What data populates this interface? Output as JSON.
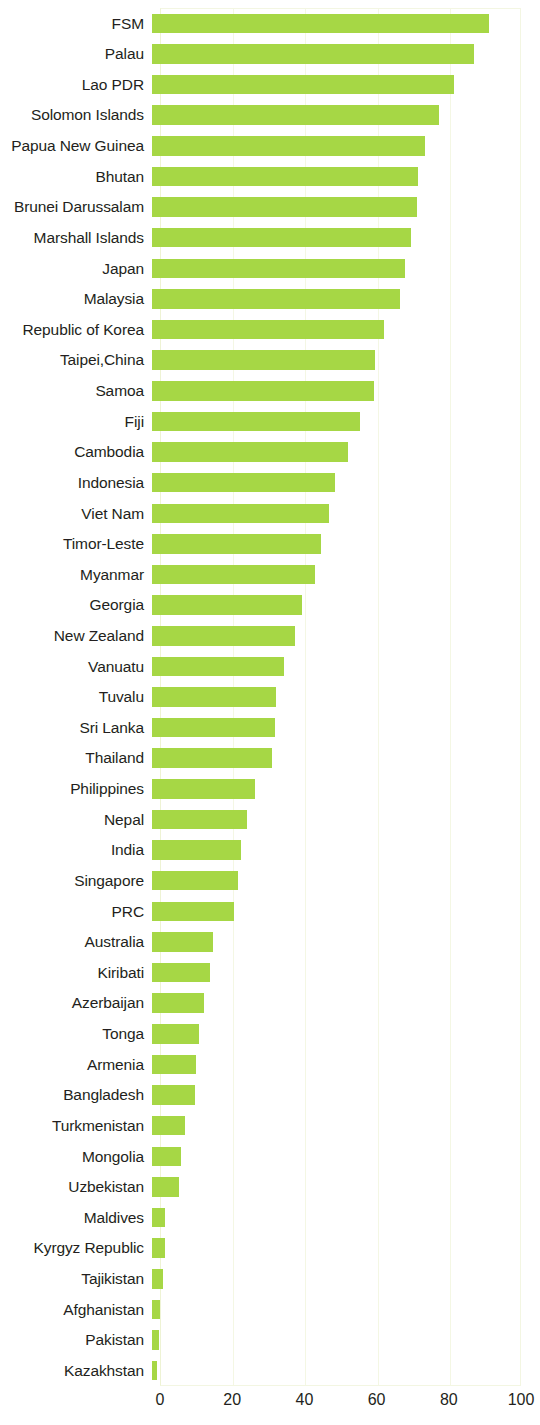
{
  "chart_data": {
    "type": "bar",
    "orientation": "horizontal",
    "title": "",
    "subtitle": "",
    "xlabel": "",
    "ylabel": "",
    "xlim": [
      0,
      100
    ],
    "xticks": [
      "0",
      "20",
      "40",
      "60",
      "80",
      "100"
    ],
    "xtick_values": [
      0,
      20,
      40,
      60,
      80,
      100
    ],
    "grid": true,
    "grid_axis": "x",
    "legend": null,
    "bar_color": "#a6d745",
    "plot_border_color": "#f3f6e2",
    "categories": [
      "FSM",
      "Palau",
      "Lao PDR",
      "Solomon Islands",
      "Papua New Guinea",
      "Bhutan",
      "Brunei Darussalam",
      "Marshall Islands",
      "Japan",
      "Malaysia",
      "Republic of Korea",
      "Taipei,China",
      "Samoa",
      "Fiji",
      "Cambodia",
      "Indonesia",
      "Viet Nam",
      "Timor-Leste",
      "Myanmar",
      "Georgia",
      "New Zealand",
      "Vanuatu",
      "Tuvalu",
      "Sri Lanka",
      "Thailand",
      "Philippines",
      "Nepal",
      "India",
      "Singapore",
      "PRC",
      "Australia",
      "Kiribati",
      "Azerbaijan",
      "Tonga",
      "Armenia",
      "Bangladesh",
      "Turkmenistan",
      "Mongolia",
      "Uzbekistan",
      "Maldives",
      "Kyrgyz Republic",
      "Tajikistan",
      "Afghanistan",
      "Pakistan",
      "Kazakhstan"
    ],
    "values": [
      93.4,
      89.1,
      83.7,
      79.4,
      75.6,
      73.8,
      73.5,
      71.7,
      70.0,
      68.7,
      64.4,
      61.8,
      61.5,
      57.5,
      54.2,
      50.7,
      49.1,
      46.9,
      45.1,
      41.5,
      39.7,
      36.7,
      34.3,
      34.1,
      33.2,
      28.4,
      26.3,
      24.7,
      23.8,
      22.6,
      16.9,
      16.1,
      14.3,
      13.1,
      12.2,
      12.0,
      9.2,
      8.1,
      7.6,
      3.5,
      3.5,
      3.0,
      2.3,
      1.9,
      1.3
    ]
  }
}
